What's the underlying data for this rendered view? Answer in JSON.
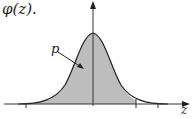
{
  "figure": {
    "title": "φ(z).",
    "region_label": "p",
    "axis_label": "z",
    "colors": {
      "curve": "#222222",
      "fill": "#bdbdbd",
      "axis": "#333333"
    }
  }
}
